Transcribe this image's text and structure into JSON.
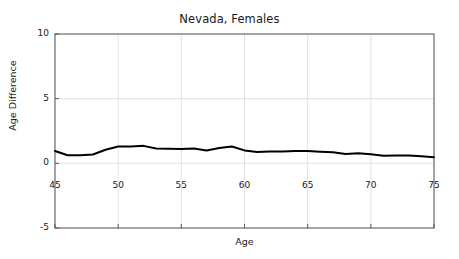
{
  "chart_data": {
    "type": "line",
    "title": "Nevada, Females",
    "xlabel": "Age",
    "ylabel": "Age Difference",
    "xlim": [
      45,
      75
    ],
    "ylim": [
      -5,
      10
    ],
    "xticks": [
      45,
      50,
      55,
      60,
      65,
      70,
      75
    ],
    "yticks": [
      -5,
      0,
      5,
      10
    ],
    "xtick_labels": [
      "45",
      "50",
      "55",
      "60",
      "65",
      "70",
      "75"
    ],
    "ytick_labels": [
      "-5",
      "0",
      "5",
      "10"
    ],
    "grid": true,
    "grid_color": "#d9d9d9",
    "axis_color": "#595959",
    "line_color": "#000000",
    "line_width": 2.0,
    "legend": null,
    "series": [
      {
        "name": "Age Difference",
        "x": [
          45,
          46,
          47,
          48,
          49,
          50,
          51,
          52,
          53,
          54,
          55,
          56,
          57,
          58,
          59,
          60,
          61,
          62,
          63,
          64,
          65,
          66,
          67,
          68,
          69,
          70,
          71,
          72,
          73,
          74,
          75
        ],
        "values": [
          0.95,
          0.62,
          0.62,
          0.68,
          1.05,
          1.3,
          1.3,
          1.35,
          1.15,
          1.12,
          1.1,
          1.15,
          1.0,
          1.18,
          1.3,
          1.0,
          0.88,
          0.92,
          0.92,
          0.95,
          0.95,
          0.9,
          0.85,
          0.72,
          0.78,
          0.7,
          0.58,
          0.6,
          0.6,
          0.55,
          0.48
        ]
      }
    ]
  }
}
